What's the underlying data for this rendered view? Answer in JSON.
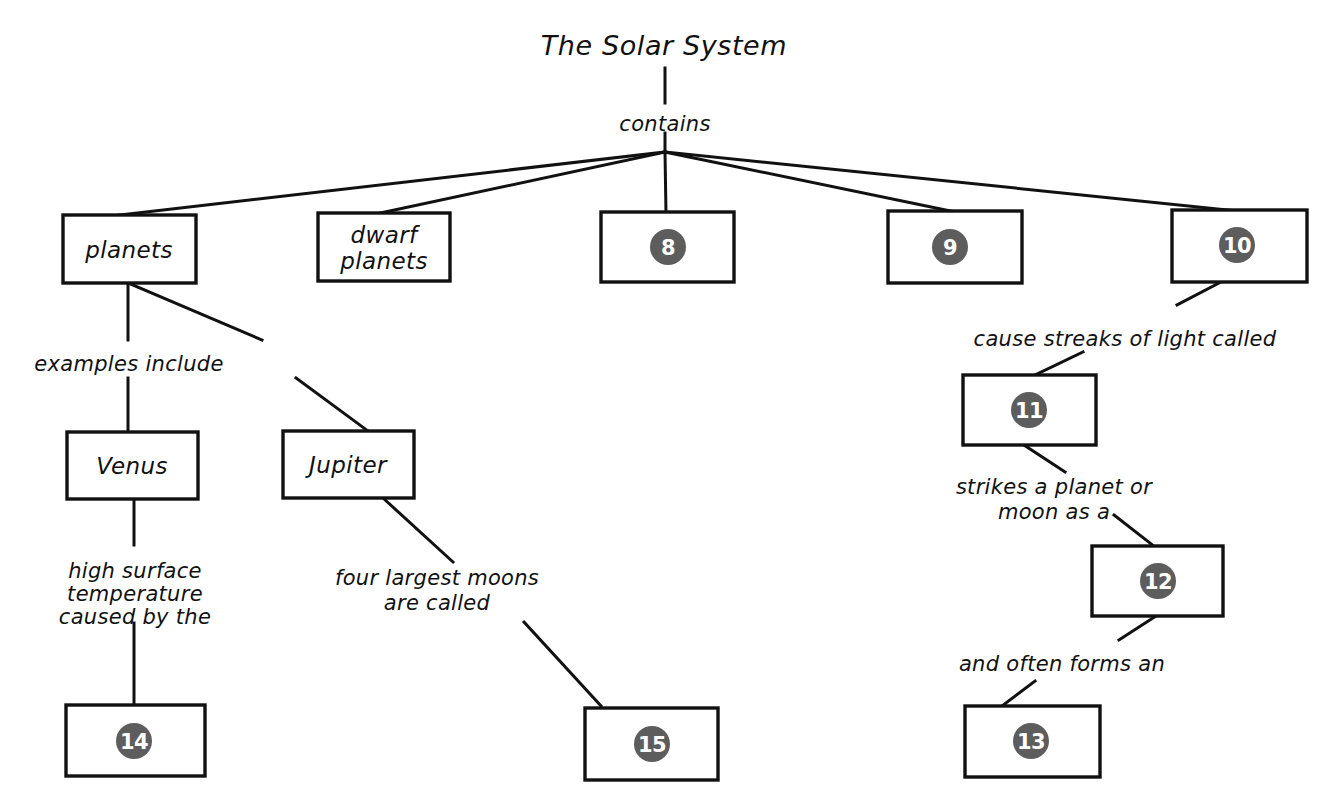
{
  "diagram": {
    "title": "The Solar System",
    "root_link_label": "contains",
    "background_color": "#ffffff",
    "ink_color": "#111111",
    "badge_color": "#5d5d5d",
    "badge_text_color": "#ffffff"
  },
  "nodes": [
    {
      "id": "root",
      "kind": "title",
      "label": "The Solar System",
      "x": 664,
      "y": 45,
      "w": 0,
      "h": 0
    },
    {
      "id": "planets",
      "kind": "box",
      "label": "planets",
      "x": 63,
      "y": 215,
      "w": 133,
      "h": 68
    },
    {
      "id": "dwarf-planets",
      "kind": "box",
      "label": "dwarf\nplanets",
      "x": 318,
      "y": 213,
      "w": 132,
      "h": 68
    },
    {
      "id": "blank-8",
      "kind": "badge",
      "label": "8",
      "x": 601,
      "y": 212,
      "w": 133,
      "h": 70
    },
    {
      "id": "blank-9",
      "kind": "badge",
      "label": "9",
      "x": 888,
      "y": 211,
      "w": 134,
      "h": 72
    },
    {
      "id": "blank-10",
      "kind": "badge",
      "label": "10",
      "x": 1172,
      "y": 210,
      "w": 135,
      "h": 72
    },
    {
      "id": "venus",
      "kind": "box",
      "label": "Venus",
      "x": 67,
      "y": 432,
      "w": 131,
      "h": 67
    },
    {
      "id": "jupiter",
      "kind": "box",
      "label": "Jupiter",
      "x": 283,
      "y": 431,
      "w": 131,
      "h": 67
    },
    {
      "id": "blank-11",
      "kind": "badge",
      "label": "11",
      "x": 963,
      "y": 375,
      "w": 133,
      "h": 70
    },
    {
      "id": "blank-12",
      "kind": "badge",
      "label": "12",
      "x": 1092,
      "y": 546,
      "w": 131,
      "h": 70
    },
    {
      "id": "blank-13",
      "kind": "badge",
      "label": "13",
      "x": 965,
      "y": 706,
      "w": 135,
      "h": 71
    },
    {
      "id": "blank-14",
      "kind": "badge",
      "label": "14",
      "x": 66,
      "y": 705,
      "w": 139,
      "h": 71
    },
    {
      "id": "blank-15",
      "kind": "badge",
      "label": "15",
      "x": 585,
      "y": 708,
      "w": 133,
      "h": 72
    }
  ],
  "link_labels": [
    {
      "id": "contains",
      "text": "contains",
      "x": 665,
      "y": 124
    },
    {
      "id": "examples-include",
      "text": "examples include",
      "x": 129,
      "y": 363
    },
    {
      "id": "cause-streaks",
      "text": "cause streaks of light called",
      "x": 1125,
      "y": 338
    },
    {
      "id": "high-surface",
      "text": "high surface\ntemperature\ncaused by the",
      "x": 135,
      "y": 580
    },
    {
      "id": "four-largest",
      "text": "four largest moons\nare called",
      "x": 435,
      "y": 587
    },
    {
      "id": "strikes-planet",
      "text": "strikes a planet or\nmoon as a",
      "x": 1054,
      "y": 495
    },
    {
      "id": "and-often-forms",
      "text": "and often forms an",
      "x": 1062,
      "y": 664
    }
  ],
  "edges": [
    {
      "id": "root-to-hub",
      "from": "root",
      "to": "contains"
    },
    {
      "id": "hub-to-planets",
      "from": "contains",
      "to": "planets"
    },
    {
      "id": "hub-to-dwarf",
      "from": "contains",
      "to": "dwarf-planets"
    },
    {
      "id": "hub-to-8",
      "from": "contains",
      "to": "blank-8"
    },
    {
      "id": "hub-to-9",
      "from": "contains",
      "to": "blank-9"
    },
    {
      "id": "hub-to-10",
      "from": "contains",
      "to": "blank-10"
    },
    {
      "id": "planets-to-venus",
      "from": "planets",
      "to": "venus",
      "label": "examples include"
    },
    {
      "id": "planets-to-jupiter",
      "from": "planets",
      "to": "jupiter",
      "label": "examples include"
    },
    {
      "id": "venus-to-14",
      "from": "venus",
      "to": "blank-14",
      "label": "high surface temperature caused by the"
    },
    {
      "id": "jupiter-to-15",
      "from": "jupiter",
      "to": "blank-15",
      "label": "four largest moons are called"
    },
    {
      "id": "ten-to-11",
      "from": "blank-10",
      "to": "blank-11",
      "label": "cause streaks of light called"
    },
    {
      "id": "eleven-to-12",
      "from": "blank-11",
      "to": "blank-12",
      "label": "strikes a planet or moon as a"
    },
    {
      "id": "twelve-to-13",
      "from": "blank-12",
      "to": "blank-13",
      "label": "and often forms an"
    }
  ]
}
